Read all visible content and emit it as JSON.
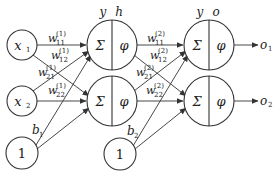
{
  "diagram": {
    "type": "neural-network",
    "inputs": [
      {
        "id": "x1",
        "label": "x",
        "sub": "1"
      },
      {
        "id": "x2",
        "label": "x",
        "sub": "2"
      }
    ],
    "biases": [
      {
        "id": "bias1",
        "value": "1",
        "label": "b",
        "sub": "1"
      },
      {
        "id": "bias2",
        "value": "1",
        "label": "b",
        "sub": "2"
      }
    ],
    "hidden_layer": {
      "header_left": "y",
      "header_right": "h",
      "sum_symbol": "Σ",
      "activation_symbol": "φ"
    },
    "output_layer": {
      "header_left": "y",
      "header_right": "o",
      "sum_symbol": "Σ",
      "activation_symbol": "φ"
    },
    "outputs": [
      {
        "label": "o",
        "sub": "1"
      },
      {
        "label": "o",
        "sub": "2"
      }
    ],
    "weights_layer1": [
      {
        "base": "w",
        "sup": "(1)",
        "sub": "11"
      },
      {
        "base": "w",
        "sup": "(1)",
        "sub": "12"
      },
      {
        "base": "w",
        "sup": "(1)",
        "sub": "21"
      },
      {
        "base": "w",
        "sup": "(1)",
        "sub": "22"
      }
    ],
    "weights_layer2": [
      {
        "base": "w",
        "sup": "(2)",
        "sub": "11"
      },
      {
        "base": "w",
        "sup": "(2)",
        "sub": "12"
      },
      {
        "base": "w",
        "sup": "(2)",
        "sub": "21"
      },
      {
        "base": "w",
        "sup": "(2)",
        "sub": "22"
      }
    ]
  }
}
